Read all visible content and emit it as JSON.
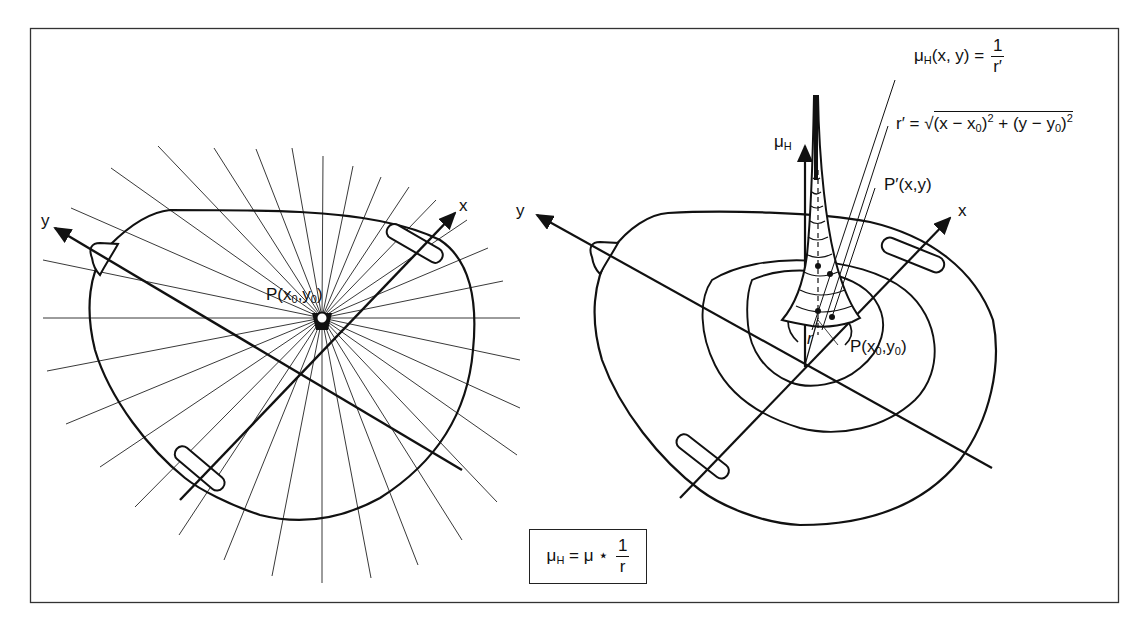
{
  "figure": {
    "type": "two-panel technical diagram"
  },
  "left_panel": {
    "axis_x_label": "x",
    "axis_y_label": "y",
    "point_label": {
      "P": "P(x",
      "sub0": "0",
      "comma": ",y",
      "sub1": "0",
      "close": ")"
    }
  },
  "right_panel": {
    "axis_x_label": "x",
    "axis_y_label": "y",
    "axis_mu_label": {
      "mu": "μ",
      "sub": "H"
    },
    "r_label": "r",
    "point_label": {
      "P": "P(x",
      "sub0": "0",
      "comma": ",y",
      "sub1": "0",
      "close": ")"
    },
    "pprime_label": "P′(x,y)",
    "eq1": {
      "lhs_mu": "μ",
      "lhs_sub": "H",
      "lhs_args": "(x, y) =",
      "num": "1",
      "den": "r′"
    },
    "eq2": {
      "lhs": "r′ =",
      "body_a": "(x − x",
      "sub_a": "0",
      "close_a": ")",
      "pow_a": "2",
      "plus": " + (y − y",
      "sub_b": "0",
      "close_b": ")",
      "pow_b": "2"
    }
  },
  "formula_box": {
    "mu": "μ",
    "sub": "H",
    "eq": " = μ ⋆ ",
    "num": "1",
    "den": "r"
  },
  "colors": {
    "ink": "#111111",
    "background": "#ffffff",
    "frame": "#333333"
  }
}
